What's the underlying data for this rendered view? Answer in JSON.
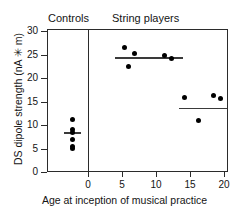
{
  "figure": {
    "group_labels": {
      "controls": "Controls",
      "string_players": "String players"
    }
  },
  "chart_data": {
    "type": "scatter",
    "title": "",
    "xlabel": "Age at inception of musical practice",
    "ylabel": "DS dipole strength (nA ✳ m)",
    "xlim": [
      -6,
      20.6
    ],
    "ylim": [
      0,
      30.4
    ],
    "xticks": [
      0,
      5,
      10,
      15,
      20
    ],
    "xticklabels": [
      "0",
      "5",
      "10",
      "15",
      "20"
    ],
    "yticks": [
      0,
      5,
      10,
      15,
      20,
      25,
      30
    ],
    "yticklabels": [
      "0",
      "5",
      "10",
      "15",
      "20",
      "25",
      "30"
    ],
    "grid": false,
    "legend": false,
    "group_divider_x": 0,
    "series": [
      {
        "name": "Controls",
        "points": [
          {
            "x": -2.3,
            "y": 11.2
          },
          {
            "x": -2.3,
            "y": 9.1
          },
          {
            "x": -2.3,
            "y": 8.3
          },
          {
            "x": -2.3,
            "y": 7.0
          },
          {
            "x": -2.3,
            "y": 5.5
          },
          {
            "x": -2.3,
            "y": 4.9
          }
        ],
        "mean": 8.3,
        "mean_line_x": [
          -3.6,
          -1.1
        ]
      },
      {
        "name": "String players, early start",
        "points": [
          {
            "x": 5.4,
            "y": 26.4
          },
          {
            "x": 6.9,
            "y": 25.2
          },
          {
            "x": 5.9,
            "y": 22.5
          },
          {
            "x": 11.3,
            "y": 24.7
          },
          {
            "x": 12.3,
            "y": 24.2
          }
        ],
        "mean": 24.3,
        "mean_line_x": [
          3.9,
          14.0
        ]
      },
      {
        "name": "String players, late start",
        "points": [
          {
            "x": 14.2,
            "y": 15.9
          },
          {
            "x": 18.4,
            "y": 16.2
          },
          {
            "x": 19.5,
            "y": 15.6
          },
          {
            "x": 16.3,
            "y": 10.9
          }
        ],
        "mean": 13.5,
        "mean_line_x": [
          13.4,
          20.5
        ]
      }
    ]
  }
}
